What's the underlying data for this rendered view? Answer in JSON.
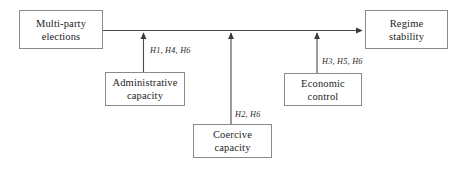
{
  "diagram": {
    "nodes": [
      {
        "id": "multiparty",
        "label": "Multi-party\nelections"
      },
      {
        "id": "regime",
        "label": "Regime\nstability"
      },
      {
        "id": "administrative",
        "label": "Administrative\ncapacity"
      },
      {
        "id": "economic",
        "label": "Economic\ncontrol"
      },
      {
        "id": "coercive",
        "label": "Coercive\ncapacity"
      }
    ],
    "edge_labels": [
      {
        "id": "h1h4h6",
        "text": "H1, H4, H6"
      },
      {
        "id": "h3h5h6",
        "text": "H3, H5, H6"
      },
      {
        "id": "h2h6",
        "text": "H2, H6"
      }
    ],
    "colors": {
      "box_border": "#8a8a8a",
      "line": "#4a4a4a",
      "text": "#1d1d1d",
      "background": "#ffffff"
    }
  }
}
